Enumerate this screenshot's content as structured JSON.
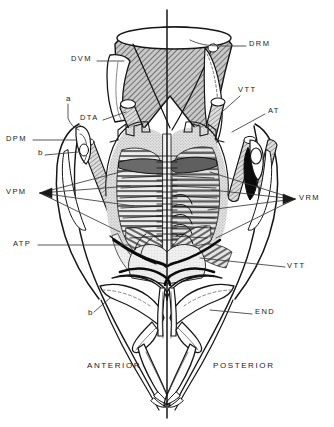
{
  "figure": {
    "orientation_labels": {
      "anterior": "ANTERIOR",
      "posterior": "POSTERIOR"
    },
    "colors": {
      "ink": "#111111",
      "line": "#2a2a2a",
      "leader": "#4a4a4a",
      "hatch_dark": "#6d6d6d",
      "hatch_mid": "#8c8c8c",
      "fill_light": "#d9d9d9",
      "fill_pale": "#ececec",
      "fill_black": "#0b0b0b",
      "background": "#ffffff"
    }
  },
  "labels": [
    {
      "id": "DRM",
      "text": "DRM",
      "x": 249,
      "y": 44,
      "type": "code"
    },
    {
      "id": "DVM",
      "text": "DVM",
      "x": 71,
      "y": 58,
      "type": "code"
    },
    {
      "id": "VTT1",
      "text": "VTT",
      "x": 238,
      "y": 90,
      "type": "code"
    },
    {
      "id": "a",
      "text": "a",
      "x": 66,
      "y": 99,
      "type": "sub"
    },
    {
      "id": "AT",
      "text": "AT",
      "x": 268,
      "y": 111,
      "type": "code"
    },
    {
      "id": "DTA",
      "text": "DTA",
      "x": 80,
      "y": 117,
      "type": "code"
    },
    {
      "id": "DPM",
      "text": "DPM",
      "x": 6,
      "y": 137,
      "type": "code"
    },
    {
      "id": "b1",
      "text": "b",
      "x": 38,
      "y": 152,
      "type": "sub"
    },
    {
      "id": "VPM",
      "text": "VPM",
      "x": 6,
      "y": 190,
      "type": "code"
    },
    {
      "id": "VRM",
      "text": "VRM",
      "x": 299,
      "y": 196,
      "type": "code"
    },
    {
      "id": "ATP",
      "text": "ATP",
      "x": 13,
      "y": 242,
      "type": "code"
    },
    {
      "id": "VTT2",
      "text": "VTT",
      "x": 287,
      "y": 264,
      "type": "code"
    },
    {
      "id": "b2",
      "text": "b",
      "x": 88,
      "y": 313,
      "type": "sub"
    },
    {
      "id": "END",
      "text": "END",
      "x": 255,
      "y": 311,
      "type": "code"
    },
    {
      "id": "ANTERIOR",
      "text": "ANTERIOR",
      "x": 87,
      "y": 365,
      "type": "orient"
    },
    {
      "id": "POSTERIOR",
      "text": "POSTERIOR",
      "x": 213,
      "y": 365,
      "type": "orient"
    }
  ],
  "abbreviations": [
    "DRM",
    "DVM",
    "VTT",
    "AT",
    "DTA",
    "DPM",
    "VPM",
    "VRM",
    "ATP",
    "END",
    "a",
    "b"
  ]
}
